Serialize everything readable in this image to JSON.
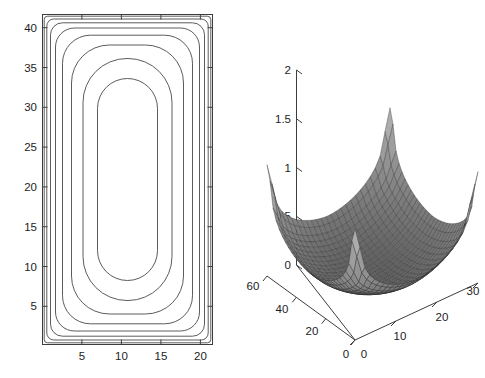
{
  "figure": {
    "background_color": "#ffffff",
    "line_color": "#3d3d3d",
    "width": 485,
    "height": 378
  },
  "chart_data": [
    {
      "type": "line",
      "name": "contour-plot",
      "title": "",
      "xlabel": "",
      "ylabel": "",
      "xlim": [
        0,
        21.5
      ],
      "ylim": [
        0,
        41.5
      ],
      "grid": false,
      "legend": null,
      "xticks": [
        5,
        10,
        15,
        20
      ],
      "yticks": [
        5,
        10,
        15,
        20,
        25,
        30,
        35,
        40
      ],
      "xtick_labels": [
        "5",
        "10",
        "15",
        "20"
      ],
      "ytick_labels": [
        "5",
        "10",
        "15",
        "20",
        "25",
        "30",
        "35",
        "40"
      ],
      "contour_count": 8,
      "contour_levels": [
        0.05,
        0.15,
        0.3,
        0.5,
        0.75,
        1.05,
        1.4,
        1.8
      ],
      "description": "Nested rounded-rectangle contour lines of a bowl-shaped field over a 21.5 by 41.5 domain; innermost contour spans roughly x 7 to 15 and y 8 to 34."
    },
    {
      "type": "line",
      "name": "surface-mesh-plot",
      "title": "",
      "xlabel": "",
      "ylabel": "",
      "zlabel": "",
      "xlim": [
        0,
        30
      ],
      "ylim": [
        0,
        60
      ],
      "zlim": [
        0,
        2
      ],
      "grid": false,
      "legend": null,
      "xticks": [
        0,
        10,
        20,
        30
      ],
      "yticks": [
        0,
        20,
        40,
        60
      ],
      "zticks": [
        0,
        0.5,
        1,
        1.5,
        2
      ],
      "xtick_labels": [
        "0",
        "10",
        "20",
        "30"
      ],
      "ytick_labels": [
        "0",
        "20",
        "40",
        "60"
      ],
      "ztick_labels": [
        "0",
        "0.5",
        "1",
        "1.5",
        "2"
      ],
      "description": "Shaded 3D mesh surface, parabolic bowl rising to sharp peaks near value 2 at the domain corners; viewed from an elevated angle with z axis on the left."
    }
  ]
}
